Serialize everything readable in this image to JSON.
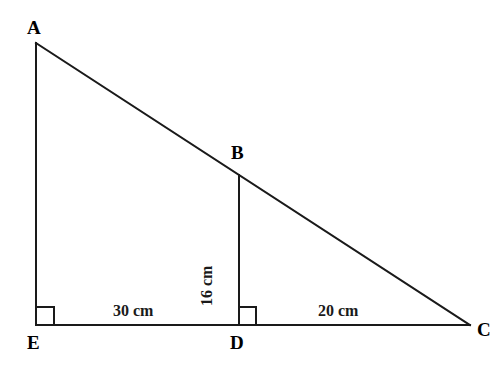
{
  "figure": {
    "background_color": "#ffffff",
    "stroke_color": "#1a1a1a",
    "stroke_width": 2,
    "width": 502,
    "height": 367,
    "vertices": [
      {
        "name": "A",
        "label": "A",
        "x": 36,
        "y": 43,
        "label_x": 27,
        "label_y": 18
      },
      {
        "name": "B",
        "label": "B",
        "x": 239,
        "y": 175,
        "label_x": 231,
        "label_y": 143
      },
      {
        "name": "C",
        "label": "C",
        "x": 470,
        "y": 325,
        "label_x": 477,
        "label_y": 320
      },
      {
        "name": "D",
        "label": "D",
        "x": 238,
        "y": 325,
        "label_x": 230,
        "label_y": 333
      },
      {
        "name": "E",
        "label": "E",
        "x": 36,
        "y": 325,
        "label_x": 27,
        "label_y": 333
      }
    ],
    "segments": [
      {
        "name": "segment-ae",
        "from": "A",
        "to": "E",
        "x1": 36,
        "y1": 43,
        "x2": 36,
        "y2": 325
      },
      {
        "name": "segment-ec",
        "from": "E",
        "to": "C",
        "x1": 36,
        "y1": 325,
        "x2": 470,
        "y2": 325
      },
      {
        "name": "segment-ac",
        "from": "A",
        "to": "C",
        "x1": 36,
        "y1": 43,
        "x2": 470,
        "y2": 325
      },
      {
        "name": "segment-bd",
        "from": "B",
        "to": "D",
        "x1": 239,
        "y1": 175,
        "x2": 239,
        "y2": 325
      }
    ],
    "right_angles": [
      {
        "name": "right-angle-e",
        "at": "E",
        "x": 36,
        "y": 325,
        "size": 18
      },
      {
        "name": "right-angle-d",
        "at": "D",
        "x": 238,
        "y": 325,
        "size": 18
      }
    ],
    "measurements": [
      {
        "name": "measure-ed",
        "text": "30 cm",
        "segment": "E-D",
        "value": 30,
        "unit": "cm",
        "x": 113,
        "y": 303,
        "orientation": "horizontal"
      },
      {
        "name": "measure-dc",
        "text": "20 cm",
        "segment": "D-C",
        "value": 20,
        "unit": "cm",
        "x": 318,
        "y": 303,
        "orientation": "horizontal"
      },
      {
        "name": "measure-bd",
        "text": "16 cm",
        "segment": "B-D",
        "value": 16,
        "unit": "cm",
        "x": 215,
        "y": 290,
        "orientation": "vertical-ccw"
      }
    ]
  }
}
